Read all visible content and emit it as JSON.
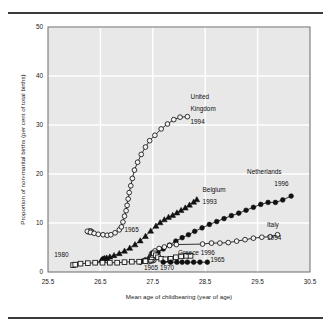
{
  "chart_data": {
    "type": "line",
    "title": "",
    "xlabel": "Mean age of childbearing (year of age)",
    "ylabel": "Proportion of non-marital births (per cent of total births)",
    "xlim": [
      25.5,
      30.5
    ],
    "ylim": [
      0,
      50
    ],
    "xticks": [
      "25.5",
      "26.5",
      "27.5",
      "28.5",
      "29.5",
      "30.5"
    ],
    "xtick_values": [
      25.5,
      26.5,
      27.5,
      28.5,
      29.5,
      30.5
    ],
    "yticks": [
      "0",
      "10",
      "20",
      "30",
      "40",
      "50"
    ],
    "ytick_values": [
      0,
      10,
      20,
      30,
      40,
      50
    ],
    "grid": true,
    "grid_color": "#ffffff",
    "plot_bg": "#e8e8e8",
    "legend_position": "inline-annotations",
    "series": [
      {
        "name": "United Kingdom",
        "marker": "open-circle",
        "color": "#111111",
        "points": [
          [
            26.33,
            8.3
          ],
          [
            26.3,
            8.4
          ],
          [
            26.27,
            8.2
          ],
          [
            26.25,
            8.3
          ],
          [
            26.31,
            8.1
          ],
          [
            26.38,
            7.9
          ],
          [
            26.46,
            7.7
          ],
          [
            26.55,
            7.6
          ],
          [
            26.63,
            7.5
          ],
          [
            26.7,
            7.6
          ],
          [
            26.78,
            8.0
          ],
          [
            26.86,
            8.6
          ],
          [
            26.9,
            9.2
          ],
          [
            26.93,
            10.2
          ],
          [
            26.96,
            11.4
          ],
          [
            26.99,
            12.5
          ],
          [
            27.01,
            13.6
          ],
          [
            27.03,
            14.9
          ],
          [
            27.05,
            16.2
          ],
          [
            27.08,
            17.6
          ],
          [
            27.11,
            19.1
          ],
          [
            27.15,
            20.8
          ],
          [
            27.21,
            22.4
          ],
          [
            27.28,
            24.0
          ],
          [
            27.36,
            25.5
          ],
          [
            27.44,
            26.8
          ],
          [
            27.54,
            27.9
          ],
          [
            27.66,
            29.2
          ],
          [
            27.78,
            30.2
          ],
          [
            27.9,
            31.1
          ],
          [
            28.02,
            31.6
          ],
          [
            28.16,
            31.7
          ]
        ]
      },
      {
        "name": "Belgium",
        "marker": "filled-triangle",
        "color": "#111111",
        "points": [
          [
            26.52,
            2.5
          ],
          [
            26.54,
            2.6
          ],
          [
            26.56,
            2.7
          ],
          [
            26.58,
            2.8
          ],
          [
            26.62,
            2.9
          ],
          [
            26.68,
            3.1
          ],
          [
            26.76,
            3.4
          ],
          [
            26.86,
            3.8
          ],
          [
            26.96,
            4.3
          ],
          [
            27.06,
            4.9
          ],
          [
            27.16,
            5.6
          ],
          [
            27.26,
            6.4
          ],
          [
            27.36,
            7.3
          ],
          [
            27.46,
            8.4
          ],
          [
            27.56,
            9.4
          ],
          [
            27.64,
            10.1
          ],
          [
            27.72,
            10.7
          ],
          [
            27.8,
            11.2
          ],
          [
            27.88,
            11.6
          ],
          [
            27.96,
            12.1
          ],
          [
            28.04,
            12.6
          ],
          [
            28.12,
            13.1
          ],
          [
            28.2,
            13.7
          ],
          [
            28.28,
            14.3
          ],
          [
            28.34,
            14.8
          ]
        ]
      },
      {
        "name": "Netherlands",
        "marker": "filled-circle",
        "color": "#111111",
        "points": [
          [
            27.26,
            2.0
          ],
          [
            27.3,
            2.2
          ],
          [
            27.36,
            2.5
          ],
          [
            27.44,
            2.9
          ],
          [
            27.52,
            3.4
          ],
          [
            27.6,
            4.0
          ],
          [
            27.7,
            4.7
          ],
          [
            27.82,
            5.5
          ],
          [
            27.94,
            6.3
          ],
          [
            28.06,
            7.0
          ],
          [
            28.18,
            7.6
          ],
          [
            28.3,
            8.3
          ],
          [
            28.44,
            9.0
          ],
          [
            28.58,
            9.7
          ],
          [
            28.72,
            10.3
          ],
          [
            28.86,
            10.9
          ],
          [
            29.0,
            11.5
          ],
          [
            29.14,
            12.0
          ],
          [
            29.28,
            12.6
          ],
          [
            29.42,
            13.2
          ],
          [
            29.56,
            13.8
          ],
          [
            29.7,
            14.2
          ],
          [
            29.84,
            14.2
          ],
          [
            29.98,
            14.7
          ],
          [
            30.14,
            15.5
          ]
        ]
      },
      {
        "name": "Italy",
        "marker": "open-circle",
        "color": "#111111",
        "points": [
          [
            27.42,
            2.1
          ],
          [
            27.46,
            2.2
          ],
          [
            27.5,
            2.3
          ],
          [
            27.52,
            2.4
          ],
          [
            27.5,
            2.6
          ],
          [
            27.48,
            2.9
          ],
          [
            27.46,
            3.3
          ],
          [
            27.48,
            3.8
          ],
          [
            27.54,
            4.3
          ],
          [
            27.62,
            4.8
          ],
          [
            27.72,
            5.1
          ],
          [
            27.82,
            5.4
          ],
          [
            27.95,
            5.6
          ],
          [
            28.45,
            5.7
          ],
          [
            28.62,
            5.9
          ],
          [
            28.78,
            5.9
          ],
          [
            28.94,
            6.0
          ],
          [
            29.1,
            6.3
          ],
          [
            29.26,
            6.6
          ],
          [
            29.42,
            6.9
          ],
          [
            29.58,
            7.1
          ],
          [
            29.74,
            7.2
          ],
          [
            29.88,
            7.6
          ]
        ]
      },
      {
        "name": "Greece",
        "marker": "open-square",
        "color": "#111111",
        "points": [
          [
            25.98,
            1.4
          ],
          [
            26.02,
            1.5
          ],
          [
            26.12,
            1.7
          ],
          [
            26.26,
            1.8
          ],
          [
            26.4,
            1.9
          ],
          [
            26.54,
            1.9
          ],
          [
            26.68,
            1.9
          ],
          [
            26.82,
            1.9
          ],
          [
            26.96,
            2.0
          ],
          [
            27.1,
            2.1
          ],
          [
            27.24,
            2.1
          ],
          [
            27.36,
            2.2
          ],
          [
            27.46,
            2.5
          ],
          [
            27.48,
            3.0
          ],
          [
            27.5,
            3.5
          ],
          [
            27.52,
            3.8
          ],
          [
            27.56,
            3.4
          ],
          [
            27.6,
            3.0
          ],
          [
            27.66,
            2.7
          ],
          [
            27.74,
            2.6
          ],
          [
            27.84,
            2.7
          ],
          [
            27.94,
            3.0
          ],
          [
            28.04,
            3.2
          ],
          [
            28.14,
            3.3
          ],
          [
            28.22,
            3.3
          ]
        ]
      },
      {
        "name": "Greece-1965-tail",
        "marker": "filled-circle",
        "color": "#111111",
        "points": [
          [
            27.7,
            2.0
          ],
          [
            27.84,
            2.0
          ],
          [
            27.96,
            2.0
          ],
          [
            28.06,
            2.0
          ],
          [
            28.16,
            2.0
          ],
          [
            28.28,
            2.0
          ],
          [
            28.4,
            2.0
          ],
          [
            28.54,
            2.0
          ]
        ]
      }
    ],
    "annotations": [
      {
        "id": "uk",
        "text": "United",
        "x": 28.22,
        "y": 35.4
      },
      {
        "id": "uk2",
        "text": "Kingdom",
        "x": 28.22,
        "y": 32.8
      },
      {
        "id": "uk3",
        "text": "1994",
        "x": 28.22,
        "y": 30.2
      },
      {
        "id": "nl",
        "text": "Netherlands",
        "x": 29.3,
        "y": 20.0
      },
      {
        "id": "nl2",
        "text": "1996",
        "x": 29.82,
        "y": 17.5
      },
      {
        "id": "be",
        "text": "Belgium",
        "x": 28.45,
        "y": 16.3
      },
      {
        "id": "be2",
        "text": "1993",
        "x": 28.45,
        "y": 13.8
      },
      {
        "id": "it",
        "text": "Italy",
        "x": 29.68,
        "y": 9.1
      },
      {
        "id": "it2",
        "text": "1994",
        "x": 29.68,
        "y": 6.6
      },
      {
        "id": "gr",
        "text": "Greece 1996",
        "x": 27.98,
        "y": 3.5
      },
      {
        "id": "g65",
        "text": "1965",
        "x": 28.6,
        "y": 2.0
      },
      {
        "id": "y80",
        "text": "1980",
        "x": 25.62,
        "y": 3.0
      },
      {
        "id": "y65",
        "text": "1965",
        "x": 26.96,
        "y": 8.1
      },
      {
        "id": "y6570",
        "text": "1965 1970",
        "x": 27.33,
        "y": 0.5
      }
    ]
  }
}
